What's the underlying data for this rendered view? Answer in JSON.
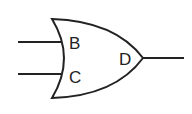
{
  "diagram": {
    "type": "logic-gate",
    "gate": "OR",
    "labels": {
      "input_top": "B",
      "input_bottom": "C",
      "output": "D"
    },
    "colors": {
      "stroke": "#222222",
      "background": "#ffffff"
    }
  }
}
